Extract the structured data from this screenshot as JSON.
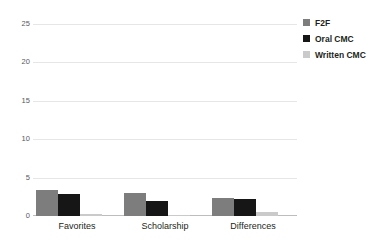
{
  "chart_data": {
    "type": "bar",
    "title": "",
    "subtitle": "",
    "xlabel": "",
    "ylabel": "",
    "categories": [
      "Favorites",
      "Scholarship",
      "Differences"
    ],
    "series": [
      {
        "name": "F2F",
        "color": "#7d7d7d",
        "values": [
          3.4,
          3.0,
          2.4
        ]
      },
      {
        "name": "Oral CMC",
        "color": "#161616",
        "values": [
          2.9,
          2.0,
          2.2
        ]
      },
      {
        "name": "Written CMC",
        "color": "#cacaca",
        "values": [
          0.2,
          0.05,
          0.5
        ]
      }
    ],
    "ylim": [
      0,
      25
    ],
    "yticks": [
      0,
      5,
      10,
      15,
      20,
      25
    ],
    "ytick_labels": [
      "0",
      "5",
      "10",
      "15",
      "20",
      "25"
    ],
    "grid": true,
    "legend_position": "right-top"
  },
  "legend": {
    "items": [
      {
        "label": "F2F",
        "color": "#7d7d7d"
      },
      {
        "label": "Oral CMC",
        "color": "#161616"
      },
      {
        "label": "Written CMC",
        "color": "#cacaca"
      }
    ]
  }
}
